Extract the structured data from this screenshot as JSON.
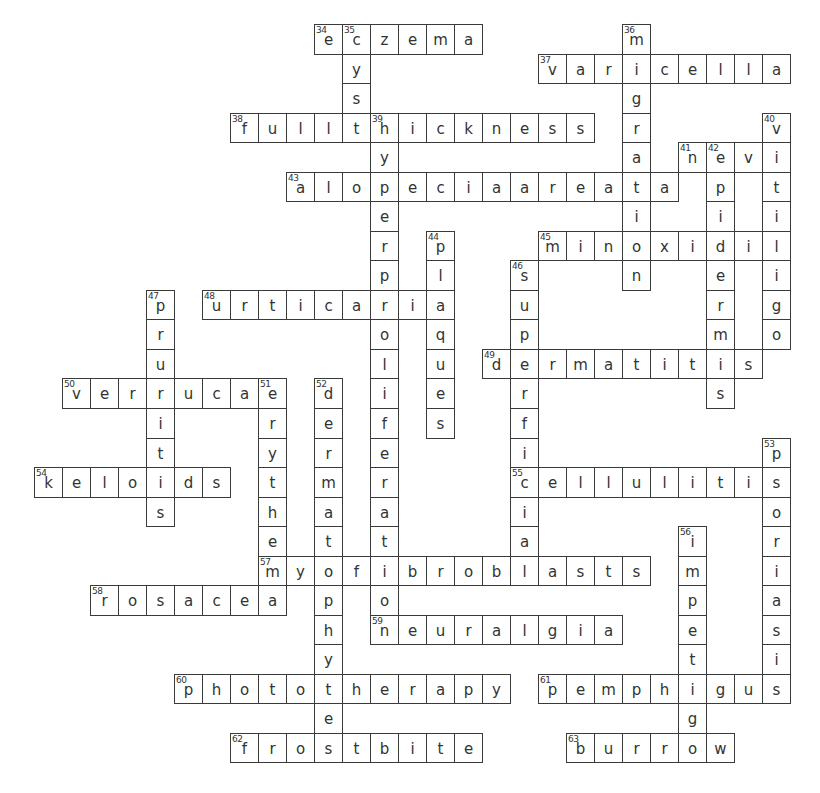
{
  "puzzle": {
    "grid": {
      "origin_x": 34,
      "origin_y": 24,
      "cell_w": 28,
      "cell_h": 29.54
    },
    "colors": {
      "border": "#3a3a3a",
      "text": "#333333",
      "background": "#ffffff"
    },
    "across": [
      {
        "number": "34",
        "answer": "eczema",
        "row": 0,
        "col": 10
      },
      {
        "number": "37",
        "answer": "varicella",
        "row": 1,
        "col": 18
      },
      {
        "number": "38",
        "answer": "fullthickness",
        "row": 3,
        "col": 7
      },
      {
        "number": "41",
        "answer": "nevi",
        "row": 4,
        "col": 23
      },
      {
        "number": "43",
        "answer": "alopeciaareata",
        "row": 5,
        "col": 9
      },
      {
        "number": "45",
        "answer": "minoxidil",
        "row": 7,
        "col": 18
      },
      {
        "number": "48",
        "answer": "urticaria",
        "row": 9,
        "col": 6
      },
      {
        "number": "49",
        "answer": "dermatitis",
        "row": 11,
        "col": 16
      },
      {
        "number": "50",
        "answer": "verrucae",
        "row": 12,
        "col": 1
      },
      {
        "number": "54",
        "answer": "keloids",
        "row": 15,
        "col": 0
      },
      {
        "number": "55",
        "answer": "cellulitis",
        "row": 15,
        "col": 17
      },
      {
        "number": "57",
        "answer": "myofibroblasts",
        "row": 18,
        "col": 8
      },
      {
        "number": "58",
        "answer": "rosacea",
        "row": 19,
        "col": 2
      },
      {
        "number": "59",
        "answer": "neuralgia",
        "row": 20,
        "col": 12
      },
      {
        "number": "60",
        "answer": "phototherapy",
        "row": 22,
        "col": 5
      },
      {
        "number": "61",
        "answer": "pemphigus",
        "row": 22,
        "col": 18
      },
      {
        "number": "62",
        "answer": "frostbite",
        "row": 24,
        "col": 7
      },
      {
        "number": "63",
        "answer": "burrow",
        "row": 24,
        "col": 19
      }
    ],
    "down": [
      {
        "number": "35",
        "answer": "cyst",
        "row": 0,
        "col": 11
      },
      {
        "number": "36",
        "answer": "migration",
        "row": 0,
        "col": 21
      },
      {
        "number": "39",
        "answer": "hyperproliferation",
        "row": 3,
        "col": 12
      },
      {
        "number": "40",
        "answer": "vitiligo",
        "row": 3,
        "col": 26
      },
      {
        "number": "42",
        "answer": "epidermis",
        "row": 4,
        "col": 24
      },
      {
        "number": "44",
        "answer": "plaques",
        "row": 7,
        "col": 14
      },
      {
        "number": "46",
        "answer": "superficial",
        "row": 8,
        "col": 17
      },
      {
        "number": "47",
        "answer": "pruritis",
        "row": 9,
        "col": 4
      },
      {
        "number": "51",
        "answer": "erythema",
        "row": 12,
        "col": 8
      },
      {
        "number": "52",
        "answer": "dermatophyte",
        "row": 12,
        "col": 10
      },
      {
        "number": "53",
        "answer": "psoriasis",
        "row": 14,
        "col": 26
      },
      {
        "number": "56",
        "answer": "impetigo",
        "row": 17,
        "col": 23
      }
    ]
  }
}
